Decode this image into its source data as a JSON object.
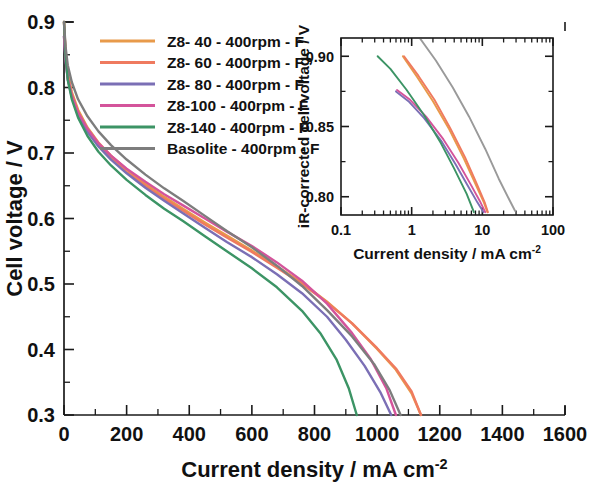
{
  "figure": {
    "background": "#ffffff",
    "axis_color": "#1a1a1a"
  },
  "chart_data": [
    {
      "id": "main",
      "type": "line",
      "title": "",
      "xlabel": "Current density / mA cm",
      "xlabel_sup": "-2",
      "ylabel": "Cell voltage / V",
      "xlim": [
        0,
        1600
      ],
      "ylim": [
        0.3,
        0.9
      ],
      "xticks": [
        0,
        200,
        400,
        600,
        800,
        1000,
        1200,
        1400,
        1600
      ],
      "xticklabels": [
        "0",
        "200",
        "400",
        "600",
        "800",
        "1000",
        "1200",
        "1400",
        "1600"
      ],
      "yticks": [
        0.3,
        0.4,
        0.5,
        0.6,
        0.7,
        0.8,
        0.9
      ],
      "yticklabels": [
        "0.3",
        "0.4",
        "0.5",
        "0.6",
        "0.7",
        "0.8",
        "0.9"
      ],
      "xminor_step": 100,
      "yminor_step": 0.05,
      "grid": false,
      "legend_position": "upper-left",
      "series": [
        {
          "name": "Z8-  40 - 400rpm - F",
          "color": "#e89a4a",
          "x": [
            0,
            5,
            12,
            25,
            45,
            75,
            110,
            150,
            200,
            260,
            320,
            380,
            450,
            520,
            600,
            680,
            760,
            840,
            920,
            1000,
            1060,
            1110,
            1140
          ],
          "y": [
            0.9,
            0.855,
            0.822,
            0.793,
            0.766,
            0.739,
            0.716,
            0.696,
            0.675,
            0.653,
            0.633,
            0.615,
            0.594,
            0.574,
            0.551,
            0.527,
            0.502,
            0.473,
            0.44,
            0.401,
            0.369,
            0.333,
            0.3
          ]
        },
        {
          "name": "Z8-  60 - 400rpm - F",
          "color": "#ef7a5f",
          "x": [
            0,
            5,
            12,
            25,
            45,
            75,
            110,
            150,
            200,
            260,
            320,
            380,
            450,
            520,
            600,
            680,
            760,
            840,
            920,
            1000,
            1060,
            1110,
            1140
          ],
          "y": [
            0.9,
            0.852,
            0.818,
            0.789,
            0.762,
            0.735,
            0.712,
            0.692,
            0.671,
            0.65,
            0.63,
            0.612,
            0.591,
            0.571,
            0.549,
            0.525,
            0.5,
            0.472,
            0.44,
            0.402,
            0.371,
            0.336,
            0.3
          ]
        },
        {
          "name": "Z8-  80 - 400rpm - F",
          "color": "#7b6fb5",
          "x": [
            0,
            5,
            12,
            25,
            45,
            75,
            110,
            150,
            200,
            260,
            320,
            380,
            450,
            520,
            600,
            680,
            760,
            840,
            900,
            960,
            1010,
            1045
          ],
          "y": [
            0.878,
            0.842,
            0.812,
            0.785,
            0.758,
            0.732,
            0.71,
            0.69,
            0.669,
            0.647,
            0.627,
            0.608,
            0.586,
            0.564,
            0.541,
            0.515,
            0.486,
            0.45,
            0.415,
            0.375,
            0.335,
            0.3
          ]
        },
        {
          "name": "Z8-100 - 400rpm - F",
          "color": "#d4549b",
          "x": [
            0,
            5,
            12,
            25,
            45,
            75,
            110,
            150,
            200,
            260,
            320,
            380,
            450,
            520,
            600,
            680,
            760,
            840,
            920,
            980,
            1030,
            1060
          ],
          "y": [
            0.878,
            0.843,
            0.814,
            0.788,
            0.762,
            0.737,
            0.715,
            0.696,
            0.676,
            0.656,
            0.637,
            0.62,
            0.6,
            0.58,
            0.558,
            0.533,
            0.505,
            0.47,
            0.425,
            0.385,
            0.34,
            0.3
          ]
        },
        {
          "name": "Z8-140 - 400rpm - F",
          "color": "#3c9465",
          "x": [
            0,
            5,
            12,
            25,
            45,
            75,
            110,
            150,
            200,
            260,
            320,
            380,
            450,
            520,
            600,
            680,
            760,
            820,
            870,
            910,
            935
          ],
          "y": [
            0.9,
            0.848,
            0.812,
            0.782,
            0.754,
            0.726,
            0.702,
            0.681,
            0.659,
            0.636,
            0.615,
            0.596,
            0.573,
            0.55,
            0.524,
            0.495,
            0.459,
            0.424,
            0.385,
            0.34,
            0.3
          ]
        },
        {
          "name": "Basolite - 400rpm - F",
          "color": "#7d7d7d",
          "x": [
            0,
            5,
            12,
            25,
            45,
            75,
            110,
            150,
            200,
            260,
            320,
            380,
            450,
            520,
            600,
            680,
            760,
            840,
            920,
            990,
            1040,
            1075
          ],
          "y": [
            0.9,
            0.862,
            0.834,
            0.808,
            0.782,
            0.756,
            0.733,
            0.712,
            0.69,
            0.667,
            0.646,
            0.627,
            0.604,
            0.581,
            0.556,
            0.528,
            0.497,
            0.46,
            0.42,
            0.378,
            0.338,
            0.3
          ]
        }
      ]
    },
    {
      "id": "inset",
      "type": "line",
      "title": "",
      "xlabel": "Current density / mA cm",
      "xlabel_sup": "-2",
      "ylabel": "iR-corrected cell voltage / V",
      "xscale": "log",
      "xlim": [
        0.1,
        100
      ],
      "ylim": [
        0.787,
        0.913
      ],
      "xticks": [
        0.1,
        1,
        10,
        100
      ],
      "xticklabels": [
        "0.1",
        "1",
        "10",
        "100"
      ],
      "yticks": [
        0.8,
        0.85,
        0.9
      ],
      "yticklabels": [
        "0.80",
        "0.85",
        "0.90"
      ],
      "yminor_step": 0.025,
      "grid": false,
      "series": [
        {
          "name": "Z8-  40 - 400rpm - F",
          "color": "#e89a4a",
          "x": [
            0.75,
            1.2,
            2.0,
            3.4,
            5.5,
            8.0,
            10.5,
            11.8
          ],
          "y": [
            0.9,
            0.885,
            0.868,
            0.848,
            0.827,
            0.809,
            0.796,
            0.789
          ]
        },
        {
          "name": "Z8-  60 - 400rpm - F",
          "color": "#ef7a5f",
          "x": [
            0.78,
            1.25,
            2.1,
            3.5,
            5.7,
            8.2,
            10.8,
            12.0
          ],
          "y": [
            0.9,
            0.886,
            0.869,
            0.849,
            0.828,
            0.81,
            0.796,
            0.789
          ]
        },
        {
          "name": "Z8-  80 - 400rpm - F",
          "color": "#7b6fb5",
          "x": [
            0.6,
            0.9,
            1.5,
            2.6,
            4.2,
            6.2,
            8.5,
            10.4
          ],
          "y": [
            0.875,
            0.868,
            0.856,
            0.84,
            0.823,
            0.808,
            0.796,
            0.789
          ]
        },
        {
          "name": "Z8-100 - 400rpm - F",
          "color": "#d4549b",
          "x": [
            0.62,
            0.95,
            1.6,
            2.8,
            4.6,
            6.8,
            9.2,
            11.0
          ],
          "y": [
            0.876,
            0.869,
            0.857,
            0.841,
            0.824,
            0.809,
            0.797,
            0.789
          ]
        },
        {
          "name": "Z8-140 - 400rpm - F",
          "color": "#3c9465",
          "x": [
            0.33,
            0.5,
            0.85,
            1.5,
            2.6,
            4.0,
            6.0,
            7.6
          ],
          "y": [
            0.9,
            0.891,
            0.876,
            0.858,
            0.838,
            0.82,
            0.802,
            0.789
          ]
        },
        {
          "name": "Basolite - 400rpm - F",
          "color": "#9a9a9a",
          "x": [
            1.3,
            2.2,
            3.8,
            6.5,
            11.0,
            17.0,
            24.0,
            29.0
          ],
          "y": [
            0.913,
            0.897,
            0.878,
            0.857,
            0.834,
            0.813,
            0.798,
            0.79
          ]
        }
      ]
    }
  ],
  "legend": {
    "entries": [
      {
        "label": "Z8-  40 - 400rpm - F",
        "color": "#e89a4a"
      },
      {
        "label": "Z8-  60 - 400rpm - F",
        "color": "#ef7a5f"
      },
      {
        "label": "Z8-  80 - 400rpm - F",
        "color": "#7b6fb5"
      },
      {
        "label": "Z8-100 - 400rpm - F",
        "color": "#d4549b"
      },
      {
        "label": "Z8-140 - 400rpm - F",
        "color": "#3c9465"
      },
      {
        "label": "Basolite - 400rpm - F",
        "color": "#7d7d7d"
      }
    ]
  }
}
